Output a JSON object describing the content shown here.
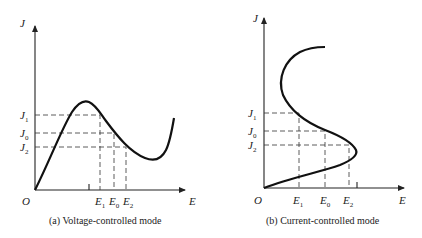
{
  "panels": [
    {
      "id": "a",
      "caption": "(a)  Voltage-controlled mode",
      "axis_x": "E",
      "axis_y": "J",
      "origin": "O",
      "y_levels": [
        {
          "main": "J",
          "sub": "1"
        },
        {
          "main": "J",
          "sub": "0"
        },
        {
          "main": "J",
          "sub": "2"
        }
      ],
      "x_levels": [
        {
          "main": "E",
          "sub": "1"
        },
        {
          "main": "E",
          "sub": "0"
        },
        {
          "main": "E",
          "sub": "2"
        }
      ]
    },
    {
      "id": "b",
      "caption": "(b)  Current-controlled mode",
      "axis_x": "E",
      "axis_y": "J",
      "origin": "O",
      "y_levels": [
        {
          "main": "J",
          "sub": "1"
        },
        {
          "main": "J",
          "sub": "0"
        },
        {
          "main": "J",
          "sub": "2"
        }
      ],
      "x_levels": [
        {
          "main": "E",
          "sub": "1"
        },
        {
          "main": "E",
          "sub": "0"
        },
        {
          "main": "E",
          "sub": "2"
        }
      ]
    }
  ]
}
